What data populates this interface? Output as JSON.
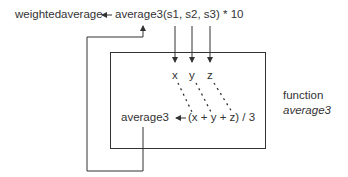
{
  "top_statement": {
    "target": "weightedaverage",
    "assign_arrow": "←",
    "call": "average3(s1, s2, s3) * 10"
  },
  "function_box": {
    "params": [
      "x",
      "y",
      "z"
    ],
    "body_target": "average3",
    "body_arrow": "←",
    "body_expr": "(x + y + z) / 3"
  },
  "side_label": {
    "line1": "function",
    "line2": "average3"
  },
  "colors": {
    "line": "#333333",
    "background": "#ffffff"
  }
}
